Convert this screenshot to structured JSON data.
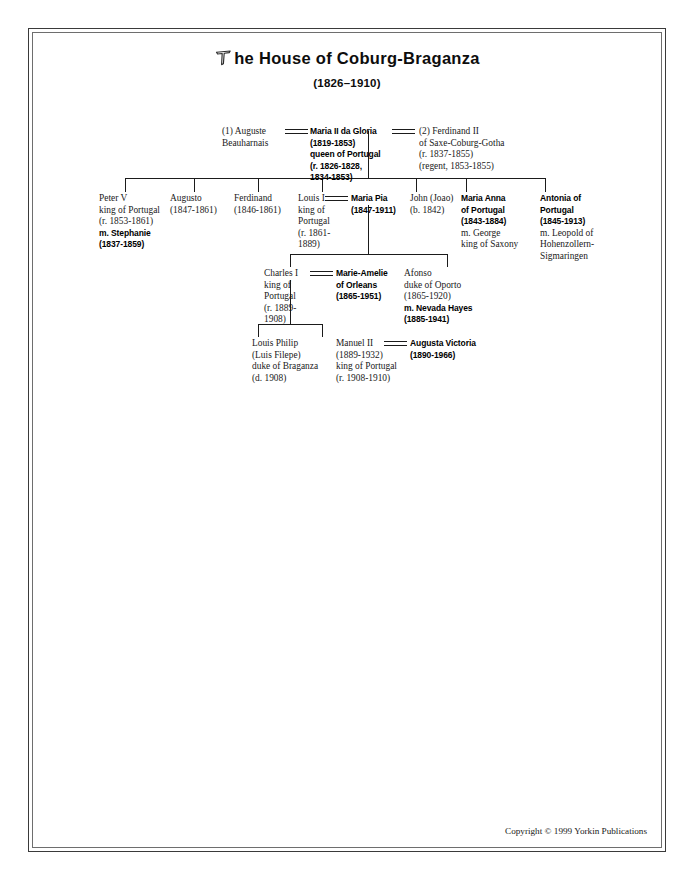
{
  "document": {
    "title_prefix_letter": "T",
    "title": "he House of Coburg-Braganza",
    "subtitle": "(1826–1910)",
    "copyright": "Copyright © 1999 Yorkin Publications"
  },
  "people": {
    "auguste": {
      "lines": [
        {
          "text": "(1) Auguste",
          "style": "regular"
        },
        {
          "text": "Beauharnais",
          "style": "regular"
        }
      ]
    },
    "maria_ii": {
      "lines": [
        {
          "text": "Maria II da Gloria",
          "style": "bold"
        },
        {
          "text": "(1819-1853)",
          "style": "bold"
        },
        {
          "text": "queen of Portugal",
          "style": "bold"
        },
        {
          "text": "(r. 1826-1828,",
          "style": "bold"
        },
        {
          "text": "1834-1853)",
          "style": "bold"
        }
      ]
    },
    "ferdinand_ii": {
      "lines": [
        {
          "text": "(2) Ferdinand II",
          "style": "regular"
        },
        {
          "text": "of Saxe-Coburg-Gotha",
          "style": "regular"
        },
        {
          "text": "(r. 1837-1855)",
          "style": "regular"
        },
        {
          "text": "(regent, 1853-1855)",
          "style": "regular"
        }
      ]
    },
    "peter_v": {
      "lines": [
        {
          "text": "Peter V",
          "style": "regular"
        },
        {
          "text": "king of Portugal",
          "style": "regular"
        },
        {
          "text": "(r. 1853-1861)",
          "style": "regular"
        },
        {
          "text": "m. Stephanie",
          "style": "bold"
        },
        {
          "text": "(1837-1859)",
          "style": "bold"
        }
      ]
    },
    "augusto": {
      "lines": [
        {
          "text": "Augusto",
          "style": "regular"
        },
        {
          "text": "(1847-1861)",
          "style": "regular"
        }
      ]
    },
    "ferdinand": {
      "lines": [
        {
          "text": "Ferdinand",
          "style": "regular"
        },
        {
          "text": "(1846-1861)",
          "style": "regular"
        }
      ]
    },
    "louis_i": {
      "lines": [
        {
          "text": "Louis I",
          "style": "regular"
        },
        {
          "text": "king of",
          "style": "regular"
        },
        {
          "text": "Portugal",
          "style": "regular"
        },
        {
          "text": "(r. 1861-",
          "style": "regular"
        },
        {
          "text": "1889)",
          "style": "regular"
        }
      ]
    },
    "maria_pia": {
      "lines": [
        {
          "text": "Maria Pia",
          "style": "bold"
        },
        {
          "text": "(1847-1911)",
          "style": "bold"
        }
      ]
    },
    "john_joao": {
      "lines": [
        {
          "text": "John (Joao)",
          "style": "regular"
        },
        {
          "text": "(b. 1842)",
          "style": "regular"
        }
      ]
    },
    "maria_anna": {
      "lines": [
        {
          "text": "Maria Anna",
          "style": "bold"
        },
        {
          "text": "of Portugal",
          "style": "bold"
        },
        {
          "text": "(1843-1884)",
          "style": "bold"
        },
        {
          "text": "m. George",
          "style": "regular"
        },
        {
          "text": "king of Saxony",
          "style": "regular"
        }
      ]
    },
    "antonia": {
      "lines": [
        {
          "text": "Antonia of",
          "style": "bold"
        },
        {
          "text": "Portugal",
          "style": "bold"
        },
        {
          "text": "(1845-1913)",
          "style": "bold"
        },
        {
          "text": "m. Leopold of",
          "style": "regular"
        },
        {
          "text": "Hohenzollern-",
          "style": "regular"
        },
        {
          "text": "Sigmaringen",
          "style": "regular"
        }
      ]
    },
    "charles_i": {
      "lines": [
        {
          "text": "Charles I",
          "style": "regular"
        },
        {
          "text": "king of",
          "style": "regular"
        },
        {
          "text": "Portugal",
          "style": "regular"
        },
        {
          "text": "(r. 1889-",
          "style": "regular"
        },
        {
          "text": "1908)",
          "style": "regular"
        }
      ]
    },
    "marie_amelie": {
      "lines": [
        {
          "text": "Marie-Amelie",
          "style": "bold"
        },
        {
          "text": "of Orleans",
          "style": "bold"
        },
        {
          "text": "(1865-1951)",
          "style": "bold"
        }
      ]
    },
    "afonso": {
      "lines": [
        {
          "text": "Afonso",
          "style": "regular"
        },
        {
          "text": "duke of Oporto",
          "style": "regular"
        },
        {
          "text": "(1865-1920)",
          "style": "regular"
        },
        {
          "text": "m. Nevada Hayes",
          "style": "bold"
        },
        {
          "text": "(1885-1941)",
          "style": "bold"
        }
      ]
    },
    "louis_philip": {
      "lines": [
        {
          "text": "Louis Philip",
          "style": "regular"
        },
        {
          "text": "(Luis Filepe)",
          "style": "regular"
        },
        {
          "text": "duke of Braganza",
          "style": "regular"
        },
        {
          "text": "(d. 1908)",
          "style": "regular"
        }
      ]
    },
    "manuel_ii": {
      "lines": [
        {
          "text": "Manuel II",
          "style": "regular"
        },
        {
          "text": "(1889-1932)",
          "style": "regular"
        },
        {
          "text": "king of Portugal",
          "style": "regular"
        },
        {
          "text": "(r. 1908-1910)",
          "style": "regular"
        }
      ]
    },
    "augusta_victoria": {
      "lines": [
        {
          "text": "Augusta Victoria",
          "style": "bold"
        },
        {
          "text": "(1890-1966)",
          "style": "bold"
        }
      ]
    }
  },
  "colors": {
    "line": "#1b1b1b",
    "frame_outer": "#3a3a3a",
    "frame_inner": "#6e6e6e",
    "text": "#1a1a1a"
  }
}
